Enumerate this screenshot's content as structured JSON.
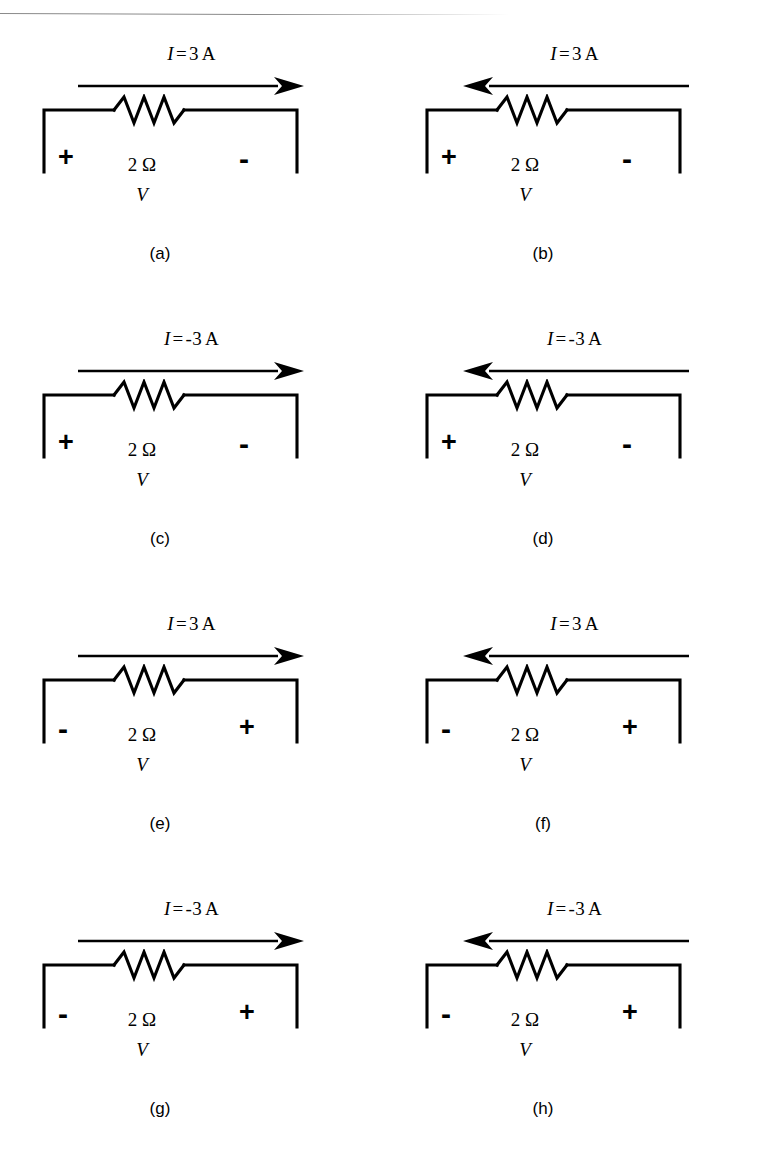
{
  "figure": {
    "type": "circuit-diagram-grid",
    "columns": 2,
    "rows": 4,
    "top_rule_color": "#8a8a8a",
    "line_color": "#000000",
    "background_color": "#ffffff"
  },
  "panels": [
    {
      "caption": "(a)",
      "current_symbol": "I",
      "equals": "=",
      "current_value": "3",
      "current_unit": "A",
      "current_text": "I = 3 A",
      "arrow_direction": "right",
      "left_terminal": "+",
      "right_terminal": "-",
      "resistance": "2 Ω",
      "voltage_symbol": "V"
    },
    {
      "caption": "(b)",
      "current_symbol": "I",
      "equals": "=",
      "current_value": "3",
      "current_unit": "A",
      "current_text": "I = 3 A",
      "arrow_direction": "left",
      "left_terminal": "+",
      "right_terminal": "-",
      "resistance": "2 Ω",
      "voltage_symbol": "V"
    },
    {
      "caption": "(c)",
      "current_symbol": "I",
      "equals": "=",
      "current_value": "-3",
      "current_unit": "A",
      "current_text": "I = -3 A",
      "arrow_direction": "right",
      "left_terminal": "+",
      "right_terminal": "-",
      "resistance": "2 Ω",
      "voltage_symbol": "V"
    },
    {
      "caption": "(d)",
      "current_symbol": "I",
      "equals": "=",
      "current_value": "-3",
      "current_unit": "A",
      "current_text": "I = -3 A",
      "arrow_direction": "left",
      "left_terminal": "+",
      "right_terminal": "-",
      "resistance": "2 Ω",
      "voltage_symbol": "V"
    },
    {
      "caption": "(e)",
      "current_symbol": "I",
      "equals": "=",
      "current_value": "3",
      "current_unit": "A",
      "current_text": "I = 3 A",
      "arrow_direction": "right",
      "left_terminal": "-",
      "right_terminal": "+",
      "resistance": "2 Ω",
      "voltage_symbol": "V"
    },
    {
      "caption": "(f)",
      "current_symbol": "I",
      "equals": "=",
      "current_value": "3",
      "current_unit": "A",
      "current_text": "I = 3 A",
      "arrow_direction": "left",
      "left_terminal": "-",
      "right_terminal": "+",
      "resistance": "2 Ω",
      "voltage_symbol": "V"
    },
    {
      "caption": "(g)",
      "current_symbol": "I",
      "equals": "=",
      "current_value": "-3",
      "current_unit": "A",
      "current_text": "I = -3 A",
      "arrow_direction": "right",
      "left_terminal": "-",
      "right_terminal": "+",
      "resistance": "2 Ω",
      "voltage_symbol": "V"
    },
    {
      "caption": "(h)",
      "current_symbol": "I",
      "equals": "=",
      "current_value": "-3",
      "current_unit": "A",
      "current_text": "I = -3 A",
      "arrow_direction": "left",
      "left_terminal": "-",
      "right_terminal": "+",
      "resistance": "2 Ω",
      "voltage_symbol": "V"
    }
  ]
}
